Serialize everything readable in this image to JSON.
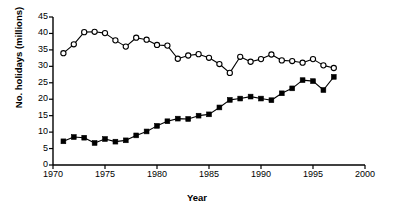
{
  "chart_data": {
    "type": "line",
    "title": "",
    "xlabel": "Year",
    "ylabel": "No. holidays (millions)",
    "xlim": [
      1970,
      2000
    ],
    "ylim": [
      0,
      45
    ],
    "xticks": [
      1970,
      1975,
      1980,
      1985,
      1990,
      1995,
      2000
    ],
    "yticks": [
      0,
      5,
      10,
      15,
      20,
      25,
      30,
      35,
      40,
      45
    ],
    "grid": false,
    "legend": "none",
    "x": [
      1971,
      1972,
      1973,
      1974,
      1975,
      1976,
      1977,
      1978,
      1979,
      1980,
      1981,
      1982,
      1983,
      1984,
      1985,
      1986,
      1987,
      1988,
      1989,
      1990,
      1991,
      1992,
      1993,
      1994,
      1995,
      1996,
      1997
    ],
    "series": [
      {
        "name": "open-circles",
        "marker": "open-circle",
        "color": "#000000",
        "values": [
          34.0,
          36.7,
          40.4,
          40.5,
          40.1,
          37.9,
          36.0,
          38.7,
          38.1,
          36.5,
          36.3,
          32.3,
          33.3,
          33.7,
          32.6,
          30.7,
          28.0,
          32.9,
          31.4,
          32.2,
          33.6,
          31.8,
          31.6,
          31.1,
          32.2,
          30.3,
          29.5
        ]
      },
      {
        "name": "filled-squares",
        "marker": "filled-square",
        "color": "#000000",
        "values": [
          7.2,
          8.5,
          8.3,
          6.7,
          7.9,
          7.1,
          7.5,
          9.0,
          10.2,
          11.9,
          13.3,
          14.1,
          14.0,
          15.0,
          15.4,
          17.5,
          19.8,
          20.2,
          20.8,
          20.2,
          19.7,
          21.8,
          23.3,
          25.8,
          25.5,
          22.8,
          26.8
        ]
      }
    ]
  }
}
